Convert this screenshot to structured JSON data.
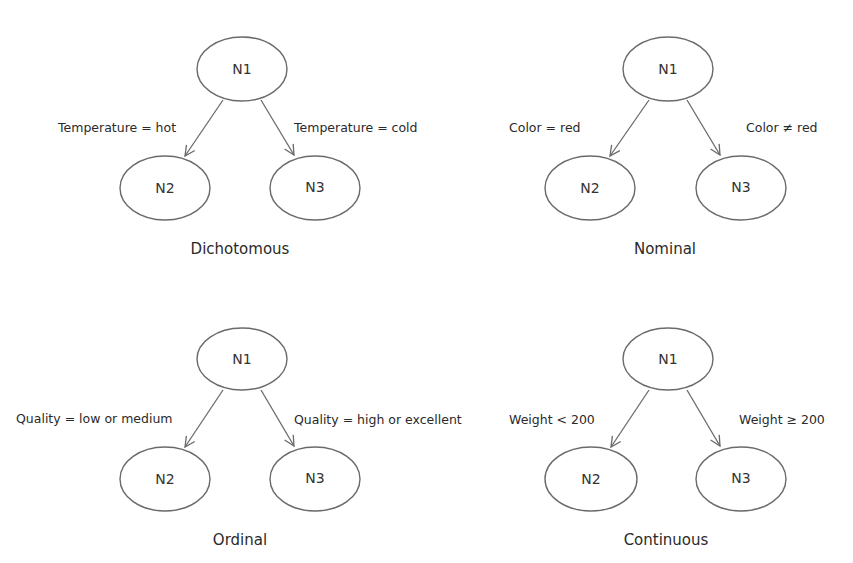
{
  "diagrams": [
    {
      "title": "Dichotomous",
      "nodes": {
        "root": "N1",
        "left": "N2",
        "right": "N3"
      },
      "left_edge_label": "Temperature = hot",
      "right_edge_label": "Temperature = cold"
    },
    {
      "title": "Nominal",
      "nodes": {
        "root": "N1",
        "left": "N2",
        "right": "N3"
      },
      "left_edge_label": "Color = red",
      "right_edge_label": "Color ≠  red"
    },
    {
      "title": "Ordinal",
      "nodes": {
        "root": "N1",
        "left": "N2",
        "right": "N3"
      },
      "left_edge_label": "Quality = low or medium",
      "right_edge_label": "Quality = high or excellent"
    },
    {
      "title": "Continuous",
      "nodes": {
        "root": "N1",
        "left": "N2",
        "right": "N3"
      },
      "left_edge_label": "Weight < 200",
      "right_edge_label": "Weight ≥  200"
    }
  ],
  "colors": {
    "stroke": "#6a6a6a",
    "text": "#2a2a2a",
    "background": "#ffffff"
  }
}
